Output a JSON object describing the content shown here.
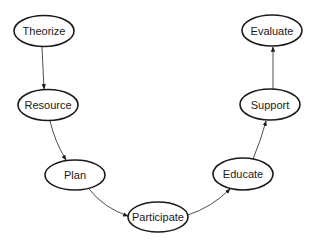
{
  "diagram": {
    "type": "flow-cycle",
    "nodes": [
      {
        "id": "theorize",
        "label": "Theorize",
        "cx": 44,
        "cy": 31
      },
      {
        "id": "resource",
        "label": "Resource",
        "cx": 48,
        "cy": 105
      },
      {
        "id": "plan",
        "label": "Plan",
        "cx": 75,
        "cy": 175
      },
      {
        "id": "participate",
        "label": "Participate",
        "cx": 158,
        "cy": 217
      },
      {
        "id": "educate",
        "label": "Educate",
        "cx": 243,
        "cy": 174
      },
      {
        "id": "support",
        "label": "Support",
        "cx": 270,
        "cy": 104
      },
      {
        "id": "evaluate",
        "label": "Evaluate",
        "cx": 272,
        "cy": 30
      }
    ],
    "edges": [
      {
        "from": "theorize",
        "to": "resource"
      },
      {
        "from": "resource",
        "to": "plan"
      },
      {
        "from": "plan",
        "to": "participate"
      },
      {
        "from": "participate",
        "to": "educate"
      },
      {
        "from": "educate",
        "to": "support"
      },
      {
        "from": "support",
        "to": "evaluate"
      }
    ]
  }
}
